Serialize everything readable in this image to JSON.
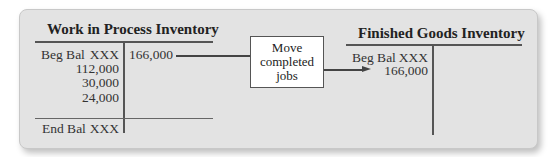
{
  "wip_account": {
    "title": "Work in Process Inventory",
    "debits": [
      {
        "label": "Beg Bal",
        "value": "XXX"
      },
      {
        "label": "",
        "value": "112,000"
      },
      {
        "label": "",
        "value": "30,000"
      },
      {
        "label": "",
        "value": "24,000"
      }
    ],
    "credits": [
      "166,000"
    ],
    "ending": {
      "label": "End Bal",
      "value": "XXX"
    }
  },
  "transfer_box": {
    "lines": [
      "Move",
      "completed",
      "jobs"
    ]
  },
  "fg_account": {
    "title": "Finished Goods Inventory",
    "debits": [
      {
        "label": "Beg Bal",
        "value": "XXX"
      },
      {
        "label": "",
        "value": "166,000"
      }
    ],
    "credits": []
  },
  "colors": {
    "panel_bg": "#e3e3e3",
    "box_bg": "#ffffff",
    "lines": "#555555"
  }
}
